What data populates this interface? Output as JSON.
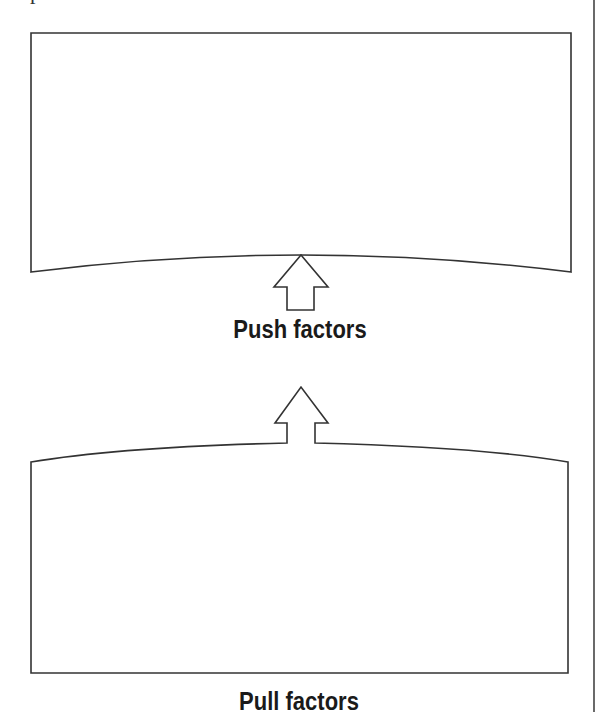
{
  "diagram": {
    "title_fragment": "p",
    "top_box": {
      "label": "",
      "description": "Empty box with concave bottom edge"
    },
    "bottom_box": {
      "label": "",
      "description": "Empty box with convex top edge and arrow"
    },
    "push_label": "Push factors",
    "pull_label": "Pull factors",
    "arrows": [
      {
        "from": "push-label",
        "to": "top-box",
        "direction": "up"
      },
      {
        "from": "bottom-box",
        "to": "push-label",
        "direction": "up"
      }
    ],
    "colors": {
      "stroke": "#333333",
      "text": "#1a1a1a",
      "background": "#ffffff"
    }
  }
}
